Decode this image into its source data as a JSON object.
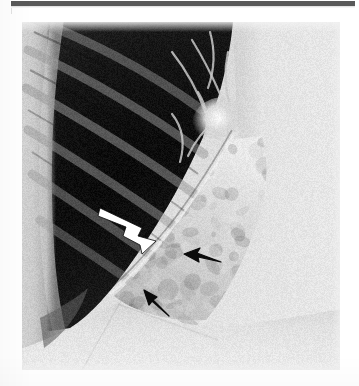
{
  "page": {
    "background_color": "#ffffff",
    "scan_bar": {
      "name": "scanned-page-header-bar",
      "color": "#595959",
      "label": ""
    }
  },
  "figure": {
    "kind": "radiograph",
    "modality": "chest-radiograph",
    "view": "lateral-oblique-coned-view",
    "frame": {
      "x": 22,
      "y": 22,
      "width": 318,
      "height": 348
    },
    "caption": "",
    "label": "",
    "tones": {
      "film_border": "#f2f2f2",
      "lung_field_dark": "#141414",
      "lung_field_mid": "#3c3c3c",
      "soft_tissue_light": "#d6d6d6",
      "mediastinum_bright": "#e8e8e8",
      "diaphragm_bright": "#e2e2e2",
      "rib_light": "#9a9a9a",
      "hilar_bright": "#f4f4f4"
    }
  },
  "annotations": {
    "title": "",
    "items": [
      {
        "id": "white-arrow",
        "name": "white-arrow-annotation",
        "color": "#ffffff",
        "outline": "#000000",
        "points_to": "major-fissure-margin",
        "direction": "right-down",
        "tail": {
          "x": 82,
          "y": 196
        },
        "tip": {
          "x": 131,
          "y": 219
        },
        "label": ""
      },
      {
        "id": "black-arrow-right",
        "name": "black-arrow-annotation-right",
        "color": "#0b0b0b",
        "outline": "#f0f0f0",
        "points_to": "consolidation-lateral-edge",
        "direction": "left",
        "tail": {
          "x": 198,
          "y": 237
        },
        "tip": {
          "x": 165,
          "y": 233
        },
        "label": ""
      },
      {
        "id": "black-arrow-lower",
        "name": "black-arrow-annotation-lower",
        "color": "#0b0b0b",
        "outline": "#f0f0f0",
        "points_to": "consolidation-inferior-edge",
        "direction": "up-left",
        "tail": {
          "x": 147,
          "y": 293
        },
        "tip": {
          "x": 124,
          "y": 270
        },
        "label": ""
      }
    ]
  },
  "chart_data": {
    "type": "heatmap",
    "title": "",
    "xlabel": "",
    "ylabel": "",
    "colorscale": [
      "#0d0d0d",
      "#2e2e2e",
      "#595959",
      "#8c8c8c",
      "#bcbcbc",
      "#e8e8e8",
      "#f6f6f6"
    ],
    "grid": false,
    "legend": "none"
  }
}
